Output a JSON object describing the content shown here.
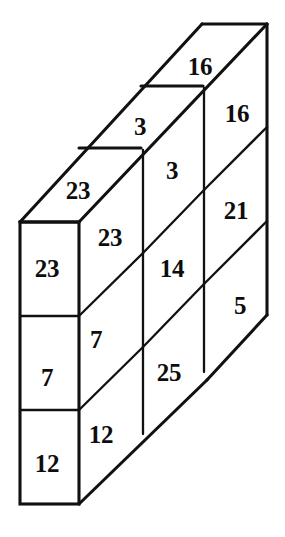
{
  "figure": {
    "type": "isometric-block-diagram",
    "stroke_color": "#111111",
    "fill_color": "#ffffff",
    "label_color": "#0d0d0d"
  },
  "labels": {
    "top_step_far": "16",
    "right_face_top": "16",
    "top_step_mid": "3",
    "middle_face_top": "3",
    "right_face_upper_mid": "21",
    "top_step_near": "23",
    "left_face_top": "23",
    "middle_face_upper_mid": "23",
    "front_face_top": "23",
    "middle_face_center": "14",
    "right_face_lower": "5",
    "left_face_mid": "7",
    "front_face_mid": "7",
    "middle_face_lower": "25",
    "left_face_bottom": "12",
    "front_face_bottom": "12"
  },
  "label_positions": {
    "top_step_far": {
      "x": 200,
      "y": 66
    },
    "right_face_top": {
      "x": 237,
      "y": 113
    },
    "top_step_mid": {
      "x": 140,
      "y": 126
    },
    "middle_face_top": {
      "x": 172,
      "y": 170
    },
    "right_face_upper_mid": {
      "x": 236,
      "y": 210
    },
    "top_step_near": {
      "x": 78,
      "y": 190
    },
    "left_face_top": {
      "x": 110,
      "y": 237
    },
    "middle_face_upper_mid": {
      "x": 110,
      "y": 237
    },
    "front_face_top": {
      "x": 47,
      "y": 268
    },
    "middle_face_center": {
      "x": 172,
      "y": 268
    },
    "right_face_lower": {
      "x": 240,
      "y": 305
    },
    "left_face_mid": {
      "x": 96,
      "y": 339
    },
    "front_face_mid": {
      "x": 47,
      "y": 377
    },
    "middle_face_lower": {
      "x": 169,
      "y": 372
    },
    "left_face_bottom": {
      "x": 101,
      "y": 434
    },
    "front_face_bottom": {
      "x": 47,
      "y": 463
    }
  },
  "geometry": {
    "front_face_rect": {
      "x": 20,
      "y": 222,
      "w": 59,
      "h": 282
    },
    "front_dividers_y": [
      316,
      410
    ],
    "vertical_interior_x": [
      143,
      204
    ],
    "outer_top_corners": [
      [
        202,
        24
      ],
      [
        267,
        24
      ]
    ],
    "outer_right_bottom": [
      267,
      315
    ],
    "back_bottom_corner": [
      207,
      380
    ]
  }
}
